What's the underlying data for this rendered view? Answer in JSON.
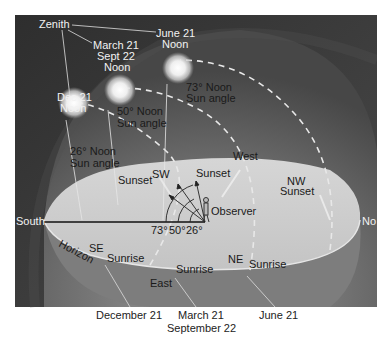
{
  "diagram": {
    "colors": {
      "background_frame": "#3a3a3a",
      "sky_dome": "#6e6e6e",
      "horizon_plane": "#cfcfcf",
      "sun_glow": "#f4f4f4",
      "label_light": "#f2f2f2",
      "label_dark": "#1a1a1a"
    },
    "labels": {
      "zenith": "Zenith",
      "june_noon": [
        "June 21",
        "Noon"
      ],
      "equinox_noon": [
        "March 21",
        "Sept 22",
        "Noon"
      ],
      "dec_noon": [
        "Dec 21",
        "Noon"
      ],
      "angle_73": [
        "73° Noon",
        "Sun angle"
      ],
      "angle_50": [
        "50° Noon",
        "Sun angle"
      ],
      "angle_26": [
        "26° Noon",
        "Sun angle"
      ],
      "west": "West",
      "sunset_sw": "Sunset",
      "sw": "SW",
      "sunset_w": "Sunset",
      "nw": "NW",
      "sunset_nw": "Sunset",
      "observer": "Observer",
      "south": "South",
      "north": "No",
      "horizon": "Horizon",
      "se": "SE",
      "sunrise_se": "Sunrise",
      "sunrise_e": "Sunrise",
      "east": "East",
      "ne": "NE",
      "sunrise_ne": "Sunrise",
      "angle_ticks": [
        "73°",
        "50°",
        "26°"
      ]
    },
    "captions": {
      "december": "December 21",
      "march": "March 21",
      "september": "September 22",
      "june": "June 21"
    },
    "sun_positions": [
      {
        "date": "June 21",
        "noon_angle_deg": 73
      },
      {
        "date": "March 21 / Sept 22",
        "noon_angle_deg": 50
      },
      {
        "date": "Dec 21",
        "noon_angle_deg": 26
      }
    ]
  }
}
